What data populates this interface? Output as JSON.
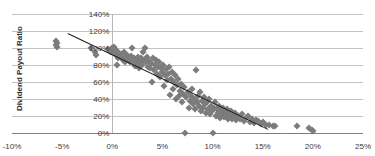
{
  "chart_data": {
    "type": "scatter",
    "title": "",
    "xlabel": "",
    "ylabel": "Dividend Payout Ratio",
    "xlim": [
      -10,
      25
    ],
    "ylim": [
      0,
      140
    ],
    "x_tick_labels": [
      "-10%",
      "-5%",
      "0%",
      "5%",
      "10%",
      "15%",
      "20%",
      "25%"
    ],
    "x_ticks": [
      -10,
      -5,
      0,
      5,
      10,
      15,
      20,
      25
    ],
    "y_tick_labels": [
      "0%",
      "20%",
      "40%",
      "60%",
      "80%",
      "100%",
      "120%",
      "140%"
    ],
    "y_ticks": [
      0,
      20,
      40,
      60,
      80,
      100,
      120,
      140
    ],
    "grid": "horizontal",
    "legend": "none",
    "marker": "diamond",
    "marker_color": "#7c7c7c",
    "trendline": {
      "color": "#1a1a1a",
      "x_start": -4.4,
      "y_start": 118,
      "x_end": 15.6,
      "y_end": 5
    },
    "series": [
      {
        "name": "Dividend Payout Ratio vs Growth",
        "points": [
          [
            -5.6,
            108
          ],
          [
            -5.6,
            104
          ],
          [
            -5.5,
            101
          ],
          [
            -5.5,
            106
          ],
          [
            -2.1,
            100
          ],
          [
            -1.7,
            95
          ],
          [
            -1.6,
            92
          ],
          [
            -0.4,
            99
          ],
          [
            -0.2,
            97
          ],
          [
            -0.1,
            95
          ],
          [
            0.0,
            100
          ],
          [
            0.1,
            98
          ],
          [
            0.2,
            101
          ],
          [
            0.2,
            96
          ],
          [
            0.3,
            94
          ],
          [
            0.3,
            99
          ],
          [
            0.4,
            92
          ],
          [
            0.5,
            97
          ],
          [
            0.5,
            80
          ],
          [
            0.6,
            88
          ],
          [
            0.8,
            93
          ],
          [
            1.0,
            90
          ],
          [
            1.1,
            86
          ],
          [
            1.2,
            95
          ],
          [
            1.3,
            84
          ],
          [
            1.4,
            89
          ],
          [
            1.5,
            92
          ],
          [
            1.6,
            87
          ],
          [
            1.8,
            83
          ],
          [
            1.9,
            91
          ],
          [
            2.0,
            100
          ],
          [
            2.1,
            85
          ],
          [
            2.2,
            88
          ],
          [
            2.3,
            79
          ],
          [
            2.4,
            86
          ],
          [
            2.5,
            82
          ],
          [
            2.6,
            90
          ],
          [
            2.7,
            77
          ],
          [
            2.8,
            84
          ],
          [
            2.9,
            88
          ],
          [
            3.0,
            80
          ],
          [
            3.1,
            95
          ],
          [
            3.2,
            86
          ],
          [
            3.3,
            100
          ],
          [
            3.4,
            83
          ],
          [
            3.5,
            90
          ],
          [
            3.6,
            78
          ],
          [
            3.7,
            85
          ],
          [
            3.8,
            76
          ],
          [
            3.9,
            82
          ],
          [
            4.0,
            60
          ],
          [
            4.1,
            88
          ],
          [
            4.2,
            74
          ],
          [
            4.3,
            80
          ],
          [
            4.4,
            86
          ],
          [
            4.5,
            70
          ],
          [
            4.6,
            78
          ],
          [
            4.7,
            84
          ],
          [
            4.8,
            66
          ],
          [
            4.9,
            76
          ],
          [
            5.0,
            72
          ],
          [
            5.1,
            80
          ],
          [
            5.2,
            55
          ],
          [
            5.3,
            68
          ],
          [
            5.4,
            75
          ],
          [
            5.5,
            62
          ],
          [
            5.6,
            70
          ],
          [
            5.7,
            78
          ],
          [
            5.8,
            45
          ],
          [
            5.9,
            64
          ],
          [
            6.0,
            72
          ],
          [
            6.1,
            52
          ],
          [
            6.2,
            60
          ],
          [
            6.3,
            68
          ],
          [
            6.4,
            40
          ],
          [
            6.5,
            56
          ],
          [
            6.6,
            64
          ],
          [
            6.7,
            44
          ],
          [
            6.8,
            50
          ],
          [
            6.9,
            58
          ],
          [
            7.0,
            36
          ],
          [
            7.1,
            46
          ],
          [
            7.2,
            54
          ],
          [
            7.3,
            0
          ],
          [
            7.4,
            42
          ],
          [
            7.5,
            48
          ],
          [
            7.6,
            30
          ],
          [
            7.7,
            38
          ],
          [
            7.8,
            44
          ],
          [
            7.9,
            52
          ],
          [
            8.0,
            34
          ],
          [
            8.1,
            40
          ],
          [
            8.2,
            28
          ],
          [
            8.3,
            74
          ],
          [
            8.4,
            36
          ],
          [
            8.5,
            44
          ],
          [
            8.6,
            32
          ],
          [
            8.7,
            48
          ],
          [
            8.8,
            26
          ],
          [
            8.9,
            38
          ],
          [
            9.0,
            30
          ],
          [
            9.1,
            42
          ],
          [
            9.2,
            34
          ],
          [
            9.3,
            24
          ],
          [
            9.4,
            36
          ],
          [
            9.5,
            28
          ],
          [
            9.6,
            40
          ],
          [
            9.7,
            22
          ],
          [
            9.8,
            32
          ],
          [
            9.9,
            26
          ],
          [
            10.0,
            0
          ],
          [
            10.1,
            30
          ],
          [
            10.2,
            36
          ],
          [
            10.3,
            20
          ],
          [
            10.4,
            28
          ],
          [
            10.5,
            24
          ],
          [
            10.6,
            32
          ],
          [
            10.7,
            18
          ],
          [
            10.8,
            26
          ],
          [
            10.9,
            22
          ],
          [
            11.0,
            30
          ],
          [
            11.1,
            19
          ],
          [
            11.2,
            25
          ],
          [
            11.3,
            21
          ],
          [
            11.4,
            28
          ],
          [
            11.5,
            17
          ],
          [
            11.6,
            24
          ],
          [
            11.7,
            20
          ],
          [
            11.8,
            26
          ],
          [
            11.9,
            16
          ],
          [
            12.0,
            22
          ],
          [
            12.1,
            19
          ],
          [
            12.2,
            24
          ],
          [
            12.3,
            15
          ],
          [
            12.5,
            20
          ],
          [
            12.7,
            17
          ],
          [
            12.9,
            22
          ],
          [
            13.1,
            14
          ],
          [
            13.3,
            18
          ],
          [
            13.5,
            20
          ],
          [
            13.7,
            13
          ],
          [
            13.9,
            16
          ],
          [
            14.1,
            12
          ],
          [
            14.3,
            15
          ],
          [
            14.5,
            14
          ],
          [
            14.8,
            11
          ],
          [
            15.0,
            13
          ],
          [
            15.3,
            10
          ],
          [
            15.6,
            9
          ],
          [
            16.0,
            8
          ],
          [
            16.2,
            8
          ],
          [
            18.4,
            8
          ],
          [
            19.6,
            6
          ],
          [
            19.9,
            4
          ],
          [
            20.0,
            2
          ]
        ]
      }
    ]
  }
}
